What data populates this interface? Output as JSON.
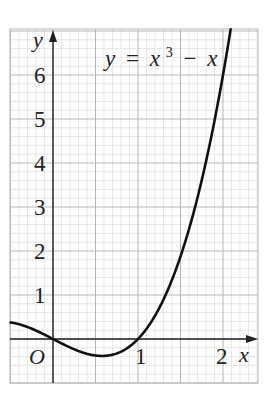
{
  "chart_data": {
    "type": "line",
    "title": "",
    "equation_label": {
      "lhs": "y",
      "eq": "=",
      "term1": "x",
      "exp": "3",
      "minus": "−",
      "term2": "x"
    },
    "function": "y = x^3 - x",
    "xlabel": "x",
    "ylabel": "y",
    "origin_label": "O",
    "xlim": [
      -0.5,
      2.4
    ],
    "ylim": [
      -1.0,
      7.05
    ],
    "x_ticks": [
      {
        "value": 1,
        "label": "1"
      },
      {
        "value": 2,
        "label": "2"
      }
    ],
    "y_ticks": [
      {
        "value": 1,
        "label": "1"
      },
      {
        "value": 2,
        "label": "2"
      },
      {
        "value": 3,
        "label": "3"
      },
      {
        "value": 4,
        "label": "4"
      },
      {
        "value": 5,
        "label": "5"
      },
      {
        "value": 6,
        "label": "6"
      }
    ],
    "grid": {
      "major_x_step": 0.5,
      "major_y_step": 1,
      "minor_x_step": 0.1,
      "minor_y_step": 0.2
    },
    "series": [
      {
        "name": "y = x^3 - x",
        "x": [
          -0.5,
          -0.4,
          -0.3,
          -0.2,
          -0.1,
          0,
          0.1,
          0.2,
          0.3,
          0.4,
          0.5,
          0.577,
          0.6,
          0.7,
          0.8,
          0.9,
          1.0,
          1.1,
          1.2,
          1.3,
          1.4,
          1.5,
          1.6,
          1.7,
          1.8,
          1.9,
          2.0,
          2.09
        ],
        "y": [
          0.375,
          0.336,
          0.273,
          0.192,
          0.099,
          0,
          -0.099,
          -0.192,
          -0.273,
          -0.336,
          -0.375,
          -0.385,
          -0.384,
          -0.357,
          -0.288,
          -0.171,
          0,
          0.231,
          0.528,
          0.897,
          1.344,
          1.875,
          2.496,
          3.213,
          4.032,
          4.959,
          6.0,
          7.04
        ]
      }
    ],
    "colors": {
      "curve": "#111111",
      "axes": "#222222",
      "grid_major": "#b8b8b8",
      "grid_minor": "#dedede",
      "frame": "#bbbbbb"
    }
  }
}
